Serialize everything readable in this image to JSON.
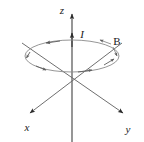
{
  "figure": {
    "background_color": "#ffffff",
    "line_color": "#6b6b6b",
    "dark_line_color": "#3a3a3a",
    "text_color": "#1a1a1a"
  },
  "axes": {
    "x": {
      "label": "x",
      "label_x": 27,
      "label_y": 131,
      "tip_x": 26,
      "tip_y": 116
    },
    "y": {
      "label": "y",
      "label_x": 127,
      "label_y": 132,
      "tip_x": 127,
      "tip_y": 116
    },
    "z": {
      "label": "z",
      "label_x": 62,
      "label_y": 13,
      "tip_x": 72,
      "tip_y": 8
    },
    "origin_x": 72,
    "origin_y": 80
  },
  "wire": {
    "current_label": "I",
    "current_label_x": 82,
    "current_label_y": 37,
    "current_arrow_tip_x": 72,
    "current_arrow_tip_y": 29
  },
  "field": {
    "label": "B",
    "label_x": 113,
    "label_y": 44,
    "center_x": 72,
    "center_y": 56,
    "radius_x": 47,
    "radius_y": 16,
    "direction_arrows": 5
  }
}
